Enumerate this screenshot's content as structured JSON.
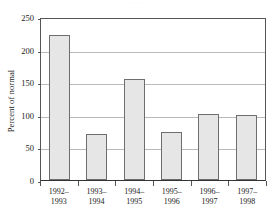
{
  "figure": {
    "top_clipped_text": "· · ·",
    "background_color": "#ffffff"
  },
  "chart_data": {
    "type": "bar",
    "title": "",
    "xlabel": "",
    "ylabel": "Percent of normal",
    "categories": [
      "1992–1993",
      "1993–1994",
      "1994–1995",
      "1995–1996",
      "1996–1997",
      "1997–1998"
    ],
    "category_lines": [
      [
        "1992–",
        "1993"
      ],
      [
        "1993–",
        "1994"
      ],
      [
        "1994–",
        "1995"
      ],
      [
        "1995–",
        "1996"
      ],
      [
        "1996–",
        "1997"
      ],
      [
        "1997–",
        "1998"
      ]
    ],
    "values": [
      222,
      70,
      155,
      73,
      102,
      99
    ],
    "ylim": [
      0,
      250
    ],
    "yticks": [
      0,
      50,
      100,
      150,
      200,
      250
    ],
    "ytick_labels": [
      "0",
      "50",
      "100",
      "150",
      "200",
      "250"
    ],
    "grid": true,
    "grid_axis": "y",
    "legend": null,
    "bar_fill_color": "#e6e6e6",
    "bar_edge_color": "#6e6e6e",
    "gridline_color": "#b9b9b9",
    "axis_color": "#555555"
  }
}
